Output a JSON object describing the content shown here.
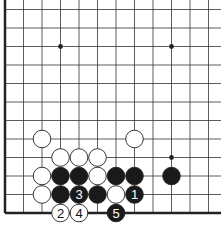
{
  "diagram": {
    "type": "go-board-fragment",
    "grid": {
      "columns": 12,
      "rows": 12,
      "origin_x": 5,
      "origin_y": 213,
      "spacing": 18.5,
      "edges": [
        "left",
        "bottom"
      ]
    },
    "star_points": [
      {
        "col": 3,
        "row": 9
      },
      {
        "col": 9,
        "row": 9
      },
      {
        "col": 9,
        "row": 3
      }
    ],
    "stones": [
      {
        "color": "white",
        "col": 2,
        "row": 4,
        "label": ""
      },
      {
        "color": "white",
        "col": 7,
        "row": 4,
        "label": ""
      },
      {
        "color": "white",
        "col": 3,
        "row": 3,
        "label": ""
      },
      {
        "color": "white",
        "col": 4,
        "row": 3,
        "label": ""
      },
      {
        "color": "white",
        "col": 5,
        "row": 3,
        "label": ""
      },
      {
        "color": "white",
        "col": 2,
        "row": 2,
        "label": ""
      },
      {
        "color": "black",
        "col": 3,
        "row": 2,
        "label": ""
      },
      {
        "color": "black",
        "col": 4,
        "row": 2,
        "label": ""
      },
      {
        "color": "white",
        "col": 5,
        "row": 2,
        "label": ""
      },
      {
        "color": "black",
        "col": 6,
        "row": 2,
        "label": ""
      },
      {
        "color": "black",
        "col": 7,
        "row": 2,
        "label": ""
      },
      {
        "color": "black",
        "col": 9,
        "row": 2,
        "label": ""
      },
      {
        "color": "white",
        "col": 2,
        "row": 1,
        "label": ""
      },
      {
        "color": "black",
        "col": 3,
        "row": 1,
        "label": ""
      },
      {
        "color": "black",
        "col": 4,
        "row": 1,
        "label": "3"
      },
      {
        "color": "black",
        "col": 5,
        "row": 1,
        "label": ""
      },
      {
        "color": "white",
        "col": 6,
        "row": 1,
        "label": ""
      },
      {
        "color": "black",
        "col": 7,
        "row": 1,
        "label": "1"
      },
      {
        "color": "white",
        "col": 3,
        "row": 0,
        "label": "2"
      },
      {
        "color": "white",
        "col": 4,
        "row": 0,
        "label": "4"
      },
      {
        "color": "black",
        "col": 6,
        "row": 0,
        "label": "5"
      }
    ],
    "colors": {
      "line": "#333333",
      "edge": "#222222",
      "black_stone": "#1a1a1a",
      "white_stone": "#ffffff",
      "stone_outline": "#222222"
    }
  }
}
